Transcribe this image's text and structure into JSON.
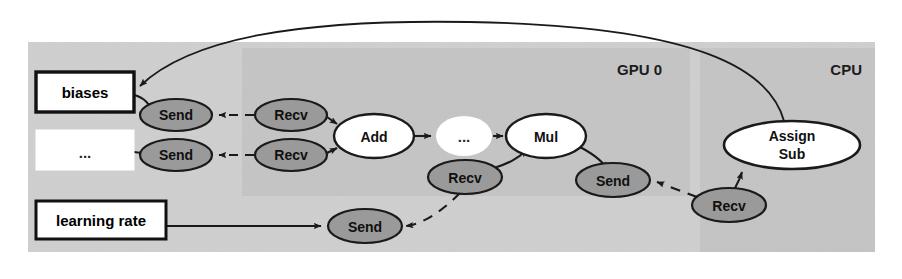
{
  "diagram": {
    "colors": {
      "outer_panel_fill": "#cfcfcf",
      "device_panel_fill": "#c2c2c2",
      "send_recv_fill": "#9a9a9a",
      "op_node_fill": "#ffffff",
      "variable_box_fill": "#ffffff",
      "edge_stroke": "#1a1a1a",
      "node_stroke": "#1a1a1a",
      "divider_fill": "#ffffff",
      "background": "#ffffff"
    },
    "panels": [
      {
        "id": "worker",
        "label": "",
        "x": 28,
        "y": 42,
        "width": 847,
        "height": 210
      },
      {
        "id": "gpu0",
        "label": "GPU 0",
        "x": 242,
        "y": 48,
        "width": 448,
        "height": 148,
        "label_x": 662,
        "label_y": 74
      },
      {
        "id": "cpu",
        "label": "CPU",
        "x": 700,
        "y": 48,
        "width": 175,
        "height": 204,
        "label_x": 861,
        "label_y": 74
      }
    ],
    "nodes": [
      {
        "id": "biases",
        "kind": "box",
        "label": "biases",
        "x": 36,
        "y": 72,
        "width": 98,
        "height": 40
      },
      {
        "id": "ellipsis-box",
        "kind": "box-plain",
        "label": "...",
        "x": 36,
        "y": 130,
        "width": 98,
        "height": 40
      },
      {
        "id": "learning-rate",
        "kind": "box",
        "label": "learning rate",
        "x": 36,
        "y": 201,
        "width": 130,
        "height": 38
      },
      {
        "id": "send-biases",
        "kind": "ellipse",
        "label": "Send",
        "cx": 176,
        "cy": 115,
        "rx": 36,
        "ry": 16
      },
      {
        "id": "send-other",
        "kind": "ellipse",
        "label": "Send",
        "cx": 176,
        "cy": 155,
        "rx": 36,
        "ry": 16
      },
      {
        "id": "recv-biases",
        "kind": "ellipse",
        "label": "Recv",
        "cx": 291,
        "cy": 115,
        "rx": 36,
        "ry": 16
      },
      {
        "id": "recv-other",
        "kind": "ellipse",
        "label": "Recv",
        "cx": 291,
        "cy": 155,
        "rx": 36,
        "ry": 16
      },
      {
        "id": "add",
        "kind": "ellipse-op",
        "label": "Add",
        "cx": 374,
        "cy": 136,
        "rx": 40,
        "ry": 22
      },
      {
        "id": "middle-dots",
        "kind": "ellipse-plain",
        "label": "...",
        "cx": 464,
        "cy": 136,
        "rx": 28,
        "ry": 20
      },
      {
        "id": "mul",
        "kind": "ellipse-op",
        "label": "Mul",
        "cx": 546,
        "cy": 136,
        "rx": 40,
        "ry": 22
      },
      {
        "id": "recv-lr",
        "kind": "ellipse",
        "label": "Recv",
        "cx": 465,
        "cy": 177,
        "rx": 37,
        "ry": 17
      },
      {
        "id": "send-grad",
        "kind": "ellipse",
        "label": "Send",
        "cx": 613,
        "cy": 180,
        "rx": 37,
        "ry": 17
      },
      {
        "id": "send-lr",
        "kind": "ellipse",
        "label": "Send",
        "cx": 365,
        "cy": 226,
        "rx": 37,
        "ry": 17
      },
      {
        "id": "recv-grad",
        "kind": "ellipse",
        "label": "Recv",
        "cx": 729,
        "cy": 205,
        "rx": 37,
        "ry": 17
      },
      {
        "id": "assign-sub",
        "kind": "ellipse-op-multiline",
        "label_line1": "Assign",
        "label_line2": "Sub",
        "cx": 792,
        "cy": 145,
        "rx": 68,
        "ry": 24
      }
    ],
    "edges": [
      {
        "id": "biases-to-send",
        "from": "biases",
        "to": "send-biases",
        "style": "solid"
      },
      {
        "id": "otherbox-to-send",
        "from": "ellipsis-box",
        "to": "send-other",
        "style": "solid"
      },
      {
        "id": "recv-to-send-biases",
        "from": "recv-biases",
        "to": "send-biases",
        "style": "dashed"
      },
      {
        "id": "recv-to-send-other",
        "from": "recv-other",
        "to": "send-other",
        "style": "dashed"
      },
      {
        "id": "recvbiases-to-add",
        "from": "recv-biases",
        "to": "add",
        "style": "solid"
      },
      {
        "id": "recvother-to-add",
        "from": "recv-other",
        "to": "add",
        "style": "solid"
      },
      {
        "id": "add-to-dots",
        "from": "add",
        "to": "middle-dots",
        "style": "solid"
      },
      {
        "id": "dots-to-mul",
        "from": "middle-dots",
        "to": "mul",
        "style": "solid"
      },
      {
        "id": "recvlr-to-mul",
        "from": "recv-lr",
        "to": "mul",
        "style": "solid"
      },
      {
        "id": "mul-to-sendgrad",
        "from": "mul",
        "to": "send-grad",
        "style": "solid"
      },
      {
        "id": "sendlr-to-recvlr",
        "from": "send-lr",
        "to": "recv-lr",
        "style": "dashed"
      },
      {
        "id": "lrbox-to-sendlr",
        "from": "learning-rate",
        "to": "send-lr",
        "style": "solid"
      },
      {
        "id": "recvgrad-to-sendgrad",
        "from": "recv-grad",
        "to": "send-grad",
        "style": "dashed"
      },
      {
        "id": "recvgrad-to-assign",
        "from": "recv-grad",
        "to": "assign-sub",
        "style": "solid"
      },
      {
        "id": "assign-to-biases",
        "from": "assign-sub",
        "to": "biases",
        "style": "solid"
      }
    ]
  }
}
